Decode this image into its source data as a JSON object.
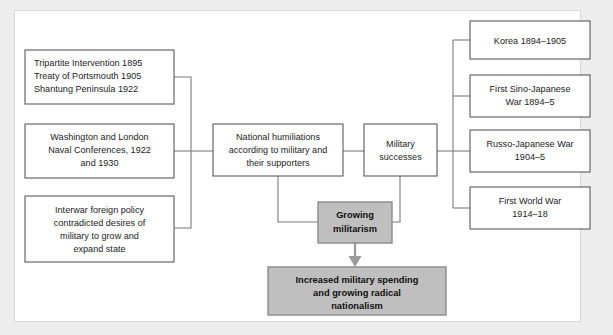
{
  "diagram": {
    "title_visible": false,
    "background_color": "#ededed",
    "panel_color": "#ffffff",
    "box_fill": "#ffffff",
    "box_stroke": "#5a5a5a",
    "highlight_fill": "#bfbfbf",
    "highlight_stroke": "#8a8a8a",
    "connector_color": "#7a7a7a"
  },
  "causes": [
    {
      "id": "cause-treaties",
      "lines": [
        "Tripartite Intervention 1895",
        "Treaty of Portsmouth 1905",
        "Shantung Peninsula 1922"
      ],
      "align": "left"
    },
    {
      "id": "cause-naval-conferences",
      "lines": [
        "Washington and London",
        "Naval Conferences, 1922",
        "and 1930"
      ],
      "align": "center"
    },
    {
      "id": "cause-interwar-policy",
      "lines": [
        "Interwar foreign policy",
        "contradicted desires of",
        "military to grow and",
        "expand state"
      ],
      "align": "center"
    }
  ],
  "middle": {
    "humiliations": {
      "id": "node-national-humiliations",
      "lines": [
        "National humiliations",
        "according to military and",
        "their supporters"
      ]
    },
    "successes": {
      "id": "node-military-successes",
      "lines": [
        "Military",
        "successes"
      ]
    }
  },
  "wars": [
    {
      "id": "war-korea",
      "lines": [
        "Korea 1894–1905"
      ]
    },
    {
      "id": "war-sino-japanese",
      "lines": [
        "First Sino-Japanese",
        "War 1894–5"
      ]
    },
    {
      "id": "war-russo-japanese",
      "lines": [
        "Russo-Japanese War",
        "1904–5"
      ]
    },
    {
      "id": "war-first-world-war",
      "lines": [
        "First World War",
        "1914–18"
      ]
    }
  ],
  "outcomes": {
    "militarism": {
      "id": "node-growing-militarism",
      "lines": [
        "Growing",
        "militarism"
      ]
    },
    "final": {
      "id": "node-increased-spending",
      "lines": [
        "Increased military spending",
        "and growing radical",
        "nationalism"
      ]
    }
  }
}
